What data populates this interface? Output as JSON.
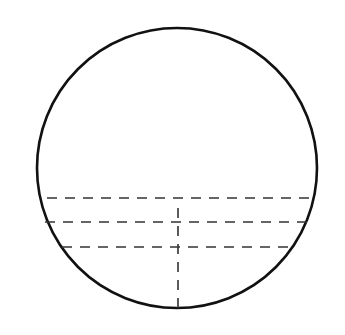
{
  "diagram": {
    "colors": {
      "background": "#ffffff",
      "stroke": "#111111",
      "dash": "#333333"
    },
    "circle": {
      "cx": 177,
      "cy": 168,
      "r": 145
    },
    "chords": [
      {
        "y": 198
      },
      {
        "y": 222
      },
      {
        "y": 247
      }
    ],
    "vertical_segment": {
      "x": 178,
      "y1": 208,
      "y2": 308
    }
  }
}
